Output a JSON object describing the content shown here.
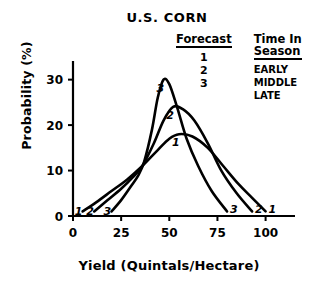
{
  "chart_data": {
    "type": "line",
    "title": "U.S. CORN",
    "xlabel": "Yield  (Quintals/Hectare)",
    "ylabel": "Probability (%)",
    "xlim": [
      0,
      108
    ],
    "ylim": [
      0,
      33
    ],
    "xticks": [
      0,
      25,
      50,
      75,
      100
    ],
    "yticks": [
      0,
      10,
      20,
      30
    ],
    "xtick_labels": [
      "0",
      "25",
      "50",
      "75",
      "100"
    ],
    "ytick_labels": [
      "0",
      "10",
      "20",
      "30"
    ],
    "grid": false,
    "legend_position": "top-right",
    "series": [
      {
        "name": "1",
        "label": "1",
        "season": "EARLY",
        "peak_x": 55,
        "peak_y": 18,
        "start_x": 5,
        "end_x": 100,
        "points": [
          [
            5,
            1
          ],
          [
            12,
            3
          ],
          [
            20,
            5.5
          ],
          [
            28,
            8
          ],
          [
            36,
            11
          ],
          [
            44,
            14.5
          ],
          [
            50,
            17
          ],
          [
            55,
            18
          ],
          [
            62,
            17.5
          ],
          [
            70,
            15
          ],
          [
            78,
            11
          ],
          [
            86,
            7
          ],
          [
            93,
            4
          ],
          [
            100,
            1
          ]
        ]
      },
      {
        "name": "2",
        "label": "2",
        "season": "MIDDLE",
        "peak_x": 52,
        "peak_y": 24,
        "start_x": 11,
        "end_x": 93,
        "points": [
          [
            11,
            1
          ],
          [
            18,
            3.5
          ],
          [
            25,
            6
          ],
          [
            31,
            8.5
          ],
          [
            36,
            11
          ],
          [
            42,
            16
          ],
          [
            47,
            21
          ],
          [
            52,
            24
          ],
          [
            57,
            23.5
          ],
          [
            63,
            21
          ],
          [
            70,
            16
          ],
          [
            77,
            10
          ],
          [
            85,
            5
          ],
          [
            93,
            1
          ]
        ]
      },
      {
        "name": "3",
        "label": "3",
        "season": "LATE",
        "peak_x": 47,
        "peak_y": 30,
        "start_x": 20,
        "end_x": 80,
        "points": [
          [
            20,
            1
          ],
          [
            25,
            3.5
          ],
          [
            30,
            6.5
          ],
          [
            34,
            9
          ],
          [
            37,
            12
          ],
          [
            41,
            19
          ],
          [
            44,
            26
          ],
          [
            47,
            30
          ],
          [
            50,
            29
          ],
          [
            54,
            24
          ],
          [
            59,
            17
          ],
          [
            65,
            11
          ],
          [
            72,
            5.5
          ],
          [
            80,
            1
          ]
        ]
      }
    ],
    "tail_labels": {
      "left": [
        "1",
        "2",
        "3"
      ],
      "right": [
        "3",
        "2",
        "1"
      ]
    }
  },
  "legend": {
    "forecast_header": "Forecast",
    "season_header": "Time In\nSeason",
    "rows": [
      {
        "forecast": "1",
        "season": "EARLY"
      },
      {
        "forecast": "2",
        "season": "MIDDLE"
      },
      {
        "forecast": "3",
        "season": "LATE"
      }
    ]
  }
}
